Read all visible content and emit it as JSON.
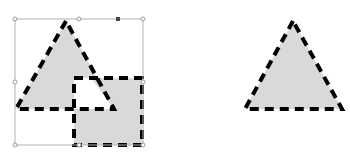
{
  "canvas": {
    "width": 350,
    "height": 162,
    "background": "#ffffff"
  },
  "colors": {
    "fill": "#d9d9d9",
    "stroke": "#000000",
    "selection_line": "#b0b0b0",
    "handle_fill": "#ffffff",
    "handle_stroke": "#9a9a9a",
    "handle_active": "#444444"
  },
  "left_group": {
    "selected": true,
    "selection_box": {
      "x": 15,
      "y": 19,
      "width": 128,
      "height": 126
    },
    "triangle": {
      "points": "66,21 16,109 114,109"
    },
    "square": {
      "x": 74,
      "y": 78,
      "width": 68,
      "height": 67
    },
    "overlap": {
      "points": "74,78 91,78 114,109 74,109"
    }
  },
  "right_shape": {
    "triangle": {
      "points": "293,21 245,109 342,109"
    }
  }
}
